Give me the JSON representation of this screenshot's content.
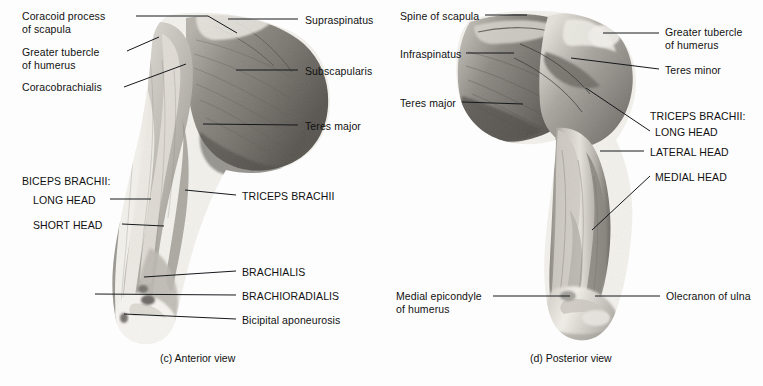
{
  "figure": {
    "background_color": "#fdfdfd",
    "text_color": "#111111",
    "leader_line_color": "#15181c"
  },
  "panels": [
    {
      "id": "anterior",
      "caption": "(c) Anterior view",
      "view": "Anterior",
      "labels": [
        {
          "id": "coracoid-process-of-scapula",
          "lines": [
            "Coracoid process",
            "of scapula"
          ],
          "style": "sentence",
          "align": "left",
          "x": 22,
          "y": 10
        },
        {
          "id": "greater-tubercle-of-humerus",
          "lines": [
            "Greater tubercle",
            "of humerus"
          ],
          "style": "sentence",
          "align": "left",
          "x": 22,
          "y": 46
        },
        {
          "id": "coracobrachialis",
          "lines": [
            "Coracobrachialis"
          ],
          "style": "sentence",
          "align": "left",
          "x": 22,
          "y": 81
        },
        {
          "id": "supraspinatus",
          "lines": [
            "Supraspinatus"
          ],
          "style": "sentence",
          "align": "left",
          "x": 305,
          "y": 14
        },
        {
          "id": "subscapularis",
          "lines": [
            "Subscapularis"
          ],
          "style": "sentence",
          "align": "left",
          "x": 305,
          "y": 65
        },
        {
          "id": "teres-major-anterior",
          "lines": [
            "Teres major"
          ],
          "style": "sentence",
          "align": "left",
          "x": 305,
          "y": 120
        },
        {
          "id": "biceps-brachii-heading",
          "lines": [
            "BICEPS BRACHII:"
          ],
          "style": "caps",
          "align": "left",
          "x": 22,
          "y": 175
        },
        {
          "id": "biceps-long-head",
          "lines": [
            "LONG HEAD"
          ],
          "style": "caps",
          "align": "left",
          "x": 33,
          "y": 194
        },
        {
          "id": "biceps-short-head",
          "lines": [
            "SHORT HEAD"
          ],
          "style": "caps",
          "align": "left",
          "x": 33,
          "y": 219
        },
        {
          "id": "triceps-brachii-anterior",
          "lines": [
            "TRICEPS BRACHII"
          ],
          "style": "caps",
          "align": "left",
          "x": 242,
          "y": 190
        },
        {
          "id": "brachialis",
          "lines": [
            "BRACHIALIS"
          ],
          "style": "caps",
          "align": "left",
          "x": 242,
          "y": 266
        },
        {
          "id": "brachioradialis",
          "lines": [
            "BRACHIORADIALIS"
          ],
          "style": "caps",
          "align": "left",
          "x": 242,
          "y": 290
        },
        {
          "id": "bicipital-aponeurosis",
          "lines": [
            "Bicipital aponeurosis"
          ],
          "style": "sentence",
          "align": "left",
          "x": 242,
          "y": 314
        }
      ]
    },
    {
      "id": "posterior",
      "caption": "(d) Posterior view",
      "view": "Posterior",
      "labels": [
        {
          "id": "spine-of-scapula",
          "lines": [
            "Spine of scapula"
          ],
          "style": "sentence",
          "align": "left",
          "x": 400,
          "y": 10
        },
        {
          "id": "infraspinatus",
          "lines": [
            "Infraspinatus"
          ],
          "style": "sentence",
          "align": "left",
          "x": 400,
          "y": 48
        },
        {
          "id": "teres-major-posterior",
          "lines": [
            "Teres major"
          ],
          "style": "sentence",
          "align": "left",
          "x": 400,
          "y": 97
        },
        {
          "id": "greater-tubercle-of-humerus-posterior",
          "lines": [
            "Greater tubercle",
            "of humerus"
          ],
          "style": "sentence",
          "align": "left",
          "x": 665,
          "y": 26
        },
        {
          "id": "teres-minor",
          "lines": [
            "Teres minor"
          ],
          "style": "sentence",
          "align": "left",
          "x": 665,
          "y": 64
        },
        {
          "id": "triceps-brachii-heading",
          "lines": [
            "TRICEPS BRACHII:"
          ],
          "style": "caps",
          "align": "left",
          "x": 650,
          "y": 110
        },
        {
          "id": "triceps-long-head",
          "lines": [
            "LONG HEAD"
          ],
          "style": "caps",
          "align": "left",
          "x": 655,
          "y": 126
        },
        {
          "id": "triceps-lateral-head",
          "lines": [
            "LATERAL HEAD"
          ],
          "style": "caps",
          "align": "left",
          "x": 650,
          "y": 146
        },
        {
          "id": "triceps-medial-head",
          "lines": [
            "MEDIAL HEAD"
          ],
          "style": "caps",
          "align": "left",
          "x": 655,
          "y": 171
        },
        {
          "id": "medial-epicondyle-of-humerus",
          "lines": [
            "Medial epicondyle",
            "of humerus"
          ],
          "style": "sentence",
          "align": "left",
          "x": 396,
          "y": 290
        },
        {
          "id": "olecranon-of-ulna",
          "lines": [
            "Olecranon of ulna"
          ],
          "style": "sentence",
          "align": "left",
          "x": 666,
          "y": 290
        }
      ]
    }
  ],
  "captions": {
    "anterior": {
      "text": "(c) Anterior view",
      "x": 160,
      "y": 352
    },
    "posterior": {
      "text": "(d) Posterior view",
      "x": 530,
      "y": 352
    }
  },
  "leader_lines": [
    {
      "id": "leader-coracoid-process",
      "points": "136,16 208,16 237,33"
    },
    {
      "id": "leader-greater-tubercle",
      "points": "127,51 159,37"
    },
    {
      "id": "leader-coracobrachialis",
      "points": "124,87 186,64"
    },
    {
      "id": "leader-supraspinatus",
      "points": "298,19 228,19"
    },
    {
      "id": "leader-subscapularis",
      "points": "298,70 236,70"
    },
    {
      "id": "leader-teres-major-ant",
      "points": "298,125 203,124"
    },
    {
      "id": "leader-biceps-long-head",
      "points": "110,199 151,199"
    },
    {
      "id": "leader-biceps-short-head",
      "points": "122,224 164,226"
    },
    {
      "id": "leader-triceps-ant",
      "points": "236,195 185,190"
    },
    {
      "id": "leader-brachialis",
      "points": "236,271 144,277"
    },
    {
      "id": "leader-brachioradialis",
      "points": "236,295 95,294"
    },
    {
      "id": "leader-bicipital-aponeurosis",
      "points": "236,319 124,314"
    },
    {
      "id": "leader-spine-of-scapula",
      "points": "485,15 527,15"
    },
    {
      "id": "leader-infraspinatus",
      "points": "466,53 514,53"
    },
    {
      "id": "leader-teres-major-post",
      "points": "462,102 523,104"
    },
    {
      "id": "leader-greater-tubercle-post",
      "points": "659,33 603,33"
    },
    {
      "id": "leader-teres-minor",
      "points": "659,69 571,58"
    },
    {
      "id": "leader-triceps-long-head",
      "points": "650,131 586,88"
    },
    {
      "id": "leader-triceps-lateral-head",
      "points": "644,151 600,151"
    },
    {
      "id": "leader-triceps-medial-head",
      "points": "650,176 592,230"
    },
    {
      "id": "leader-medial-epicondyle",
      "points": "493,296 570,296"
    },
    {
      "id": "leader-olecranon",
      "points": "660,296 595,296"
    }
  ]
}
